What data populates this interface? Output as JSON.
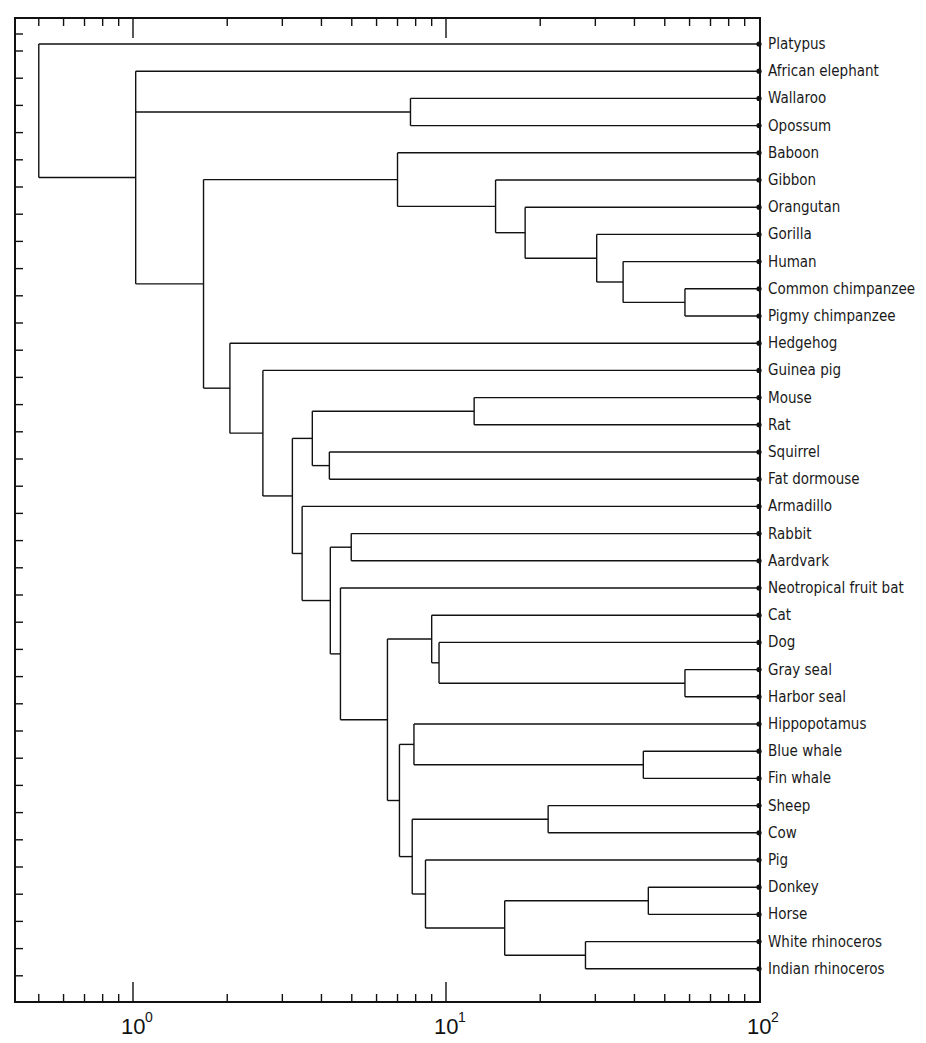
{
  "chart_data": {
    "type": "dendrogram",
    "title": "",
    "xlabel": "",
    "ylabel": "",
    "x_scale": "log",
    "xlim": [
      0.41,
      100
    ],
    "x_tick_labels": [
      {
        "value": 1,
        "base": "10",
        "exp": "0"
      },
      {
        "value": 10,
        "base": "10",
        "exp": "1"
      },
      {
        "value": 100,
        "base": "10",
        "exp": "2"
      }
    ],
    "leaves": [
      "Platypus",
      "African elephant",
      "Wallaroo",
      "Opossum",
      "Baboon",
      "Gibbon",
      "Orangutan",
      "Gorilla",
      "Human",
      "Common chimpanzee",
      "Pigmy chimpanzee",
      "Hedgehog",
      "Guinea pig",
      "Mouse",
      "Rat",
      "Squirrel",
      "Fat dormouse",
      "Armadillo",
      "Rabbit",
      "Aardvark",
      "Neotropical fruit bat",
      "Cat",
      "Dog",
      "Gray seal",
      "Harbor seal",
      "Hippopotamus",
      "Blue whale",
      "Fin whale",
      "Sheep",
      "Cow",
      "Pig",
      "Donkey",
      "Horse",
      "White rhinoceros",
      "Indian rhinoceros"
    ],
    "leaf_height": 100,
    "tree": {
      "h": 0.5,
      "children": [
        {
          "leaf": 0
        },
        {
          "h": 1.02,
          "children": [
            {
              "leaf": 1
            },
            {
              "h": 7.7,
              "children": [
                {
                  "leaf": 2
                },
                {
                  "leaf": 3
                }
              ]
            },
            {
              "h": 1.68,
              "children": [
                {
                  "h": 7.0,
                  "children": [
                    {
                      "leaf": 4
                    },
                    {
                      "h": 14.4,
                      "children": [
                        {
                          "leaf": 5
                        },
                        {
                          "h": 17.9,
                          "children": [
                            {
                              "leaf": 6
                            },
                            {
                              "h": 30.3,
                              "children": [
                                {
                                  "leaf": 7
                                },
                                {
                                  "h": 36.8,
                                  "children": [
                                    {
                                      "leaf": 8
                                    },
                                    {
                                      "h": 58,
                                      "children": [
                                        {
                                          "leaf": 9
                                        },
                                        {
                                          "leaf": 10
                                        }
                                      ]
                                    }
                                  ]
                                }
                              ]
                            }
                          ]
                        }
                      ]
                    }
                  ]
                },
                {
                  "h": 2.04,
                  "children": [
                    {
                      "leaf": 11
                    },
                    {
                      "h": 2.6,
                      "children": [
                        {
                          "leaf": 12
                        },
                        {
                          "h": 3.23,
                          "children": [
                            {
                              "h": 3.74,
                              "children": [
                                {
                                  "h": 12.3,
                                  "children": [
                                    {
                                      "leaf": 13
                                    },
                                    {
                                      "leaf": 14
                                    }
                                  ]
                                },
                                {
                                  "h": 4.24,
                                  "children": [
                                    {
                                      "leaf": 15
                                    },
                                    {
                                      "leaf": 16
                                    }
                                  ]
                                }
                              ]
                            },
                            {
                              "h": 3.47,
                              "children": [
                                {
                                  "leaf": 17
                                },
                                {
                                  "h": 4.27,
                                  "children": [
                                    {
                                      "h": 4.98,
                                      "children": [
                                        {
                                          "leaf": 18
                                        },
                                        {
                                          "leaf": 19
                                        }
                                      ]
                                    },
                                    {
                                      "h": 4.6,
                                      "children": [
                                        {
                                          "leaf": 20
                                        },
                                        {
                                          "h": 6.5,
                                          "children": [
                                            {
                                              "h": 9.0,
                                              "children": [
                                                {
                                                  "leaf": 21
                                                },
                                                {
                                                  "h": 9.5,
                                                  "children": [
                                                    {
                                                      "leaf": 22
                                                    },
                                                    {
                                                      "h": 58,
                                                      "children": [
                                                        {
                                                          "leaf": 23
                                                        },
                                                        {
                                                          "leaf": 24
                                                        }
                                                      ]
                                                    }
                                                  ]
                                                }
                                              ]
                                            },
                                            {
                                              "h": 7.1,
                                              "children": [
                                                {
                                                  "h": 7.9,
                                                  "children": [
                                                    {
                                                      "leaf": 25
                                                    },
                                                    {
                                                      "h": 42.7,
                                                      "children": [
                                                        {
                                                          "leaf": 26
                                                        },
                                                        {
                                                          "leaf": 27
                                                        }
                                                      ]
                                                    }
                                                  ]
                                                },
                                                {
                                                  "h": 7.8,
                                                  "children": [
                                                    {
                                                      "h": 21.2,
                                                      "children": [
                                                        {
                                                          "leaf": 28
                                                        },
                                                        {
                                                          "leaf": 29
                                                        }
                                                      ]
                                                    },
                                                    {
                                                      "h": 8.6,
                                                      "children": [
                                                        {
                                                          "leaf": 30
                                                        },
                                                        {
                                                          "h": 15.4,
                                                          "children": [
                                                            {
                                                              "h": 44.3,
                                                              "children": [
                                                                {
                                                                  "leaf": 31
                                                                },
                                                                {
                                                                  "leaf": 32
                                                                }
                                                              ]
                                                            },
                                                            {
                                                              "h": 27.9,
                                                              "children": [
                                                                {
                                                                  "leaf": 33
                                                                },
                                                                {
                                                                  "leaf": 34
                                                                }
                                                              ]
                                                            }
                                                          ]
                                                        }
                                                      ]
                                                    }
                                                  ]
                                                }
                                              ]
                                            }
                                          ]
                                        }
                                      ]
                                    }
                                  ]
                                }
                              ]
                            }
                          ]
                        }
                      ]
                    }
                  ]
                }
              ]
            }
          ]
        }
      ]
    },
    "grid": false,
    "legend": null
  },
  "layout": {
    "frame": {
      "left": 15,
      "top": 18,
      "right": 760,
      "bottom": 1002
    },
    "x_origin_px": 133,
    "decade_px": 313,
    "leaf_y0": 44,
    "leaf_dy": 27.2
  }
}
